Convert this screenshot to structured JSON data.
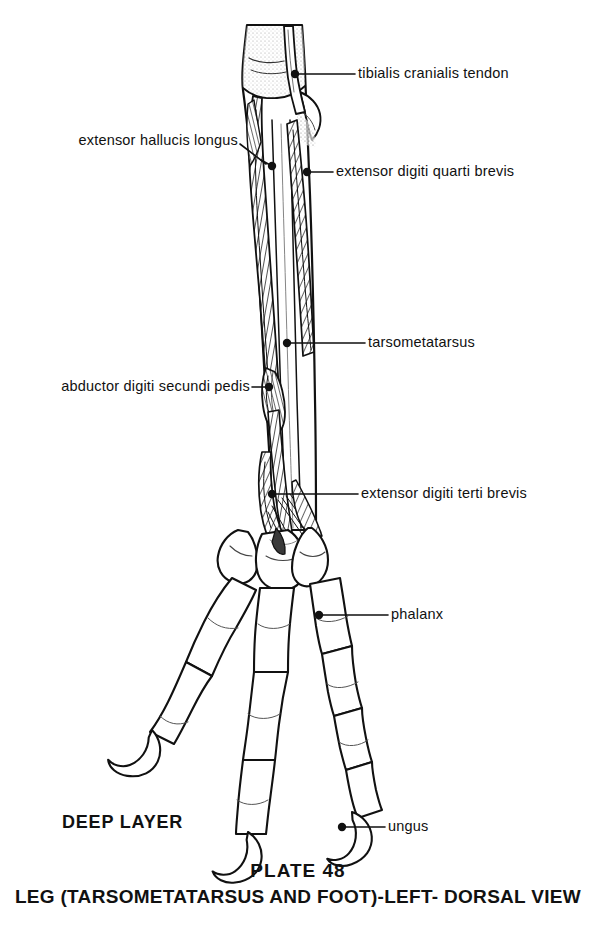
{
  "plate": {
    "layer_label": "DEEP LAYER",
    "number": "PLATE 48",
    "caption": "LEG (TARSOMETATARSUS AND FOOT)-LEFT- DORSAL VIEW",
    "ink_color": "#111111",
    "paper_color": "#ffffff"
  },
  "callouts": [
    {
      "id": "tibialis-cranialis-tendon",
      "label": "tibialis cranialis tendon",
      "side": "right"
    },
    {
      "id": "extensor-hallucis-longus",
      "label": "extensor hallucis longus",
      "side": "left"
    },
    {
      "id": "extensor-digiti-quarti-brevis",
      "label": "extensor digiti quarti brevis",
      "side": "right"
    },
    {
      "id": "tarsometatarsus",
      "label": "tarsometatarsus",
      "side": "right"
    },
    {
      "id": "abductor-digiti-secundi-pedis",
      "label": "abductor digiti secundi pedis",
      "side": "left"
    },
    {
      "id": "extensor-digiti-terti-brevis",
      "label": "extensor digiti terti brevis",
      "side": "right"
    },
    {
      "id": "phalanx",
      "label": "phalanx",
      "side": "right"
    },
    {
      "id": "ungus",
      "label": "ungus",
      "side": "right"
    }
  ]
}
